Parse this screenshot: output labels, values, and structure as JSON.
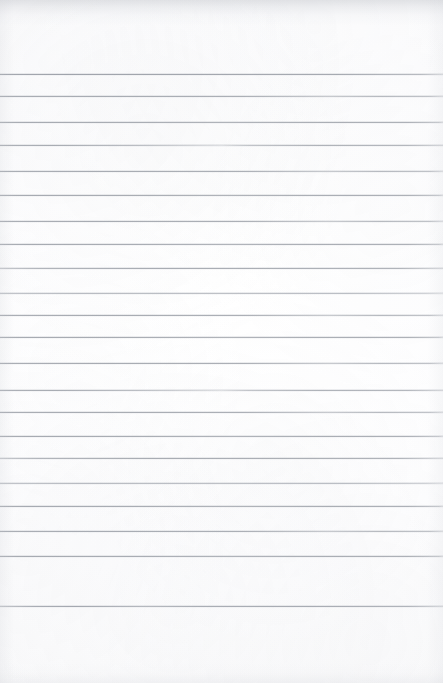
{
  "document": {
    "type": "scanned-ruled-paper",
    "title": "",
    "content_text": "",
    "is_blank": true,
    "page_width": 443,
    "page_height": 683
  },
  "paper": {
    "background_color": "#fcfcfd",
    "edge_color": "#f4f4f6",
    "texture": "subtle-scan-grain",
    "top_margin_px": 74,
    "bottom_margin_px": 77
  },
  "ruling": {
    "line_color": "#a5a9b0",
    "line_thickness_px": 1,
    "line_spacing_px": 24.3,
    "line_count": 22,
    "first_line_y": 74,
    "last_line_y": 606,
    "left_inset_px": 0,
    "right_inset_px": 0,
    "margin_rule": "none",
    "lines": [
      {
        "y": 74,
        "variant": "v-dark"
      },
      {
        "y": 96,
        "variant": "v-fade-right"
      },
      {
        "y": 122,
        "variant": ""
      },
      {
        "y": 145,
        "variant": "v-fade-mid"
      },
      {
        "y": 171,
        "variant": "v-fade-right"
      },
      {
        "y": 195,
        "variant": ""
      },
      {
        "y": 221,
        "variant": "v-fade-right"
      },
      {
        "y": 244,
        "variant": ""
      },
      {
        "y": 268,
        "variant": "v-fade-left"
      },
      {
        "y": 293,
        "variant": "v-light"
      },
      {
        "y": 315,
        "variant": "v-fade-right"
      },
      {
        "y": 337,
        "variant": ""
      },
      {
        "y": 363,
        "variant": "v-fade-right"
      },
      {
        "y": 390,
        "variant": "v-fade-mid"
      },
      {
        "y": 412,
        "variant": "v-fade-right"
      },
      {
        "y": 436,
        "variant": ""
      },
      {
        "y": 458,
        "variant": "v-fade-left"
      },
      {
        "y": 483,
        "variant": "v-light"
      },
      {
        "y": 506,
        "variant": ""
      },
      {
        "y": 531,
        "variant": "v-fade-right"
      },
      {
        "y": 556,
        "variant": ""
      },
      {
        "y": 606,
        "variant": "v-wobble"
      }
    ]
  },
  "annotations": {
    "handwriting": [],
    "stamps": [],
    "headers": [],
    "page_number": ""
  }
}
